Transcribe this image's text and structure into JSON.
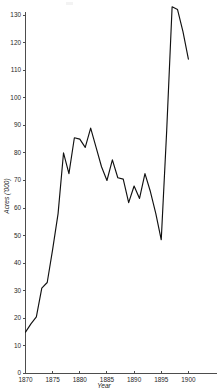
{
  "chart_data": {
    "type": "line",
    "title": "",
    "xlabel": "Year",
    "ylabel": "Acres ('000)",
    "xlim": [
      1870,
      1903
    ],
    "ylim": [
      0,
      133
    ],
    "grid": false,
    "legend": "none",
    "x_ticks": [
      1870,
      1875,
      1880,
      1885,
      1890,
      1895,
      1900
    ],
    "y_ticks": [
      0,
      10,
      20,
      30,
      40,
      50,
      60,
      70,
      80,
      90,
      100,
      110,
      120,
      130
    ],
    "x": [
      1870,
      1871,
      1872,
      1873,
      1874,
      1875,
      1876,
      1877,
      1878,
      1879,
      1880,
      1881,
      1882,
      1883,
      1884,
      1885,
      1886,
      1887,
      1888,
      1889,
      1890,
      1891,
      1892,
      1893,
      1894,
      1895,
      1896,
      1897,
      1898,
      1899,
      1900
    ],
    "values": [
      15,
      18,
      20.5,
      31,
      33,
      45,
      58,
      80,
      72.5,
      85.5,
      85,
      82,
      89,
      82,
      75,
      70,
      77.5,
      71,
      70.5,
      62,
      68,
      63.5,
      72.5,
      66,
      58,
      48.5,
      88,
      133,
      132,
      124,
      114
    ],
    "series": [
      {
        "name": "Acres",
        "values": [
          15,
          18,
          20.5,
          31,
          33,
          45,
          58,
          80,
          72.5,
          85.5,
          85,
          82,
          89,
          82,
          75,
          70,
          77.5,
          71,
          70.5,
          62,
          68,
          63.5,
          72.5,
          66,
          58,
          48.5,
          88,
          133,
          132,
          124,
          114
        ],
        "color": "#111111"
      }
    ],
    "annotations": []
  },
  "axes": {
    "y_axis_label": "Acres ('000)",
    "x_axis_label": "Year",
    "y_tick_labels": [
      "0",
      "10",
      "20",
      "30",
      "40",
      "50",
      "60",
      "70",
      "80",
      "90",
      "100",
      "110",
      "120",
      "130"
    ],
    "x_tick_labels": [
      "1870",
      "1875",
      "1880",
      "1885",
      "1890",
      "1895",
      "1900"
    ]
  },
  "colors": {
    "line": "#111111",
    "axis": "#4d4d4d",
    "text": "#262626",
    "background": "#ffffff"
  }
}
